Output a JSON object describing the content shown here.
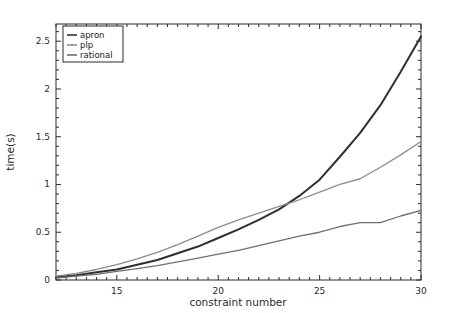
{
  "chart_data": {
    "type": "line",
    "title": "",
    "xlabel": "constraint number",
    "ylabel": "time(s)",
    "xlim": [
      12,
      30
    ],
    "ylim": [
      0,
      2.68
    ],
    "xticks": [
      15,
      20,
      25,
      30
    ],
    "xtick_labels": [
      "15",
      "20",
      "25",
      "30"
    ],
    "yticks": [
      0,
      0.5,
      1,
      1.5,
      2,
      2.5
    ],
    "ytick_labels": [
      "0",
      "0.5",
      "1",
      "1.5",
      "2",
      "2.5"
    ],
    "grid": false,
    "legend_position": "upper left",
    "minor_ticks": true,
    "x": [
      12,
      13,
      14,
      15,
      16,
      17,
      18,
      19,
      20,
      21,
      22,
      23,
      24,
      25,
      26,
      27,
      28,
      29,
      30
    ],
    "series": [
      {
        "name": "apron",
        "color": "#303030",
        "width": 2.0,
        "values": [
          0.03,
          0.05,
          0.08,
          0.11,
          0.16,
          0.21,
          0.28,
          0.35,
          0.44,
          0.53,
          0.63,
          0.74,
          0.88,
          1.05,
          1.29,
          1.54,
          1.83,
          2.18,
          2.55
        ]
      },
      {
        "name": "plp",
        "color": "#8c8c8c",
        "width": 1.3,
        "values": [
          0.04,
          0.07,
          0.11,
          0.16,
          0.22,
          0.29,
          0.37,
          0.46,
          0.55,
          0.63,
          0.7,
          0.77,
          0.84,
          0.92,
          1.0,
          1.06,
          1.18,
          1.31,
          1.45
        ]
      },
      {
        "name": "rational",
        "color": "#707070",
        "width": 1.3,
        "values": [
          0.02,
          0.04,
          0.06,
          0.09,
          0.12,
          0.15,
          0.19,
          0.23,
          0.27,
          0.31,
          0.36,
          0.41,
          0.46,
          0.5,
          0.56,
          0.6,
          0.6,
          0.67,
          0.73
        ]
      }
    ],
    "legend_entries": [
      "apron",
      "plp",
      "rational"
    ]
  },
  "legend": {
    "items": [
      {
        "label": "apron"
      },
      {
        "label": "plp"
      },
      {
        "label": "rational"
      }
    ]
  },
  "axes": {
    "x_title": "constraint number",
    "y_title": "time(s)"
  }
}
